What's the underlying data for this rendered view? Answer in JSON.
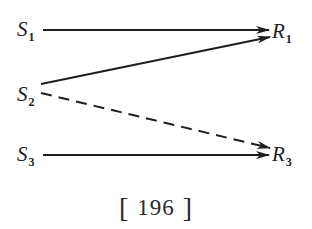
{
  "diagram": {
    "nodes": {
      "s1": {
        "symbol": "S",
        "subscript": "1"
      },
      "s2": {
        "symbol": "S",
        "subscript": "2"
      },
      "s3": {
        "symbol": "S",
        "subscript": "3"
      },
      "r1": {
        "symbol": "R",
        "subscript": "1"
      },
      "r3": {
        "symbol": "R",
        "subscript": "3"
      }
    },
    "edges": [
      {
        "from": "S1",
        "to": "R1",
        "style": "solid"
      },
      {
        "from": "S2",
        "to": "R1",
        "style": "solid"
      },
      {
        "from": "S2",
        "to": "R3",
        "style": "dashed"
      },
      {
        "from": "S3",
        "to": "R3",
        "style": "solid"
      }
    ],
    "caption": {
      "left_bracket": "[",
      "number": "196",
      "right_bracket": "]"
    },
    "colors": {
      "ink": "#1e1e1e",
      "background": "#ffffff"
    }
  }
}
